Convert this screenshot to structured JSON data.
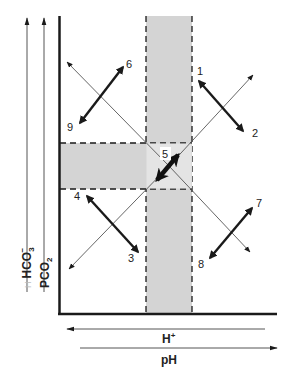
{
  "diagram": {
    "title": "",
    "colors": {
      "band": "#d4d4d4",
      "ink": "#1a1a1a",
      "thin_line": "#555555",
      "background": "#ffffff"
    },
    "y_axis_labels": [
      {
        "id": "hco3",
        "text": "HCO",
        "sub": "3",
        "sup": "−",
        "prefix": "H"
      },
      {
        "id": "pco2",
        "text": "PCO",
        "sub": "2"
      }
    ],
    "x_axis_labels": [
      {
        "id": "hplus",
        "text": "H",
        "sup": "+",
        "direction": "left"
      },
      {
        "id": "ph",
        "text": "pH",
        "direction": "right"
      }
    ],
    "bands": {
      "vertical": {
        "description": "normal pH range band"
      },
      "horizontal": {
        "description": "normal HCO3/PCO2 range band"
      }
    },
    "arrow_labels": {
      "n1": "1",
      "n2": "2",
      "n3": "3",
      "n4": "4",
      "n5": "5",
      "n6": "6",
      "n7": "7",
      "n8": "8",
      "n9": "9"
    },
    "double_arrows": [
      {
        "ends": [
          "1",
          "2"
        ],
        "quadrant": "upper-right"
      },
      {
        "ends": [
          "6",
          "9"
        ],
        "quadrant": "upper-left"
      },
      {
        "ends": [
          "4",
          "3"
        ],
        "quadrant": "lower-left"
      },
      {
        "ends": [
          "7",
          "8"
        ],
        "quadrant": "lower-right"
      },
      {
        "ends": [
          "5"
        ],
        "quadrant": "center"
      }
    ]
  }
}
